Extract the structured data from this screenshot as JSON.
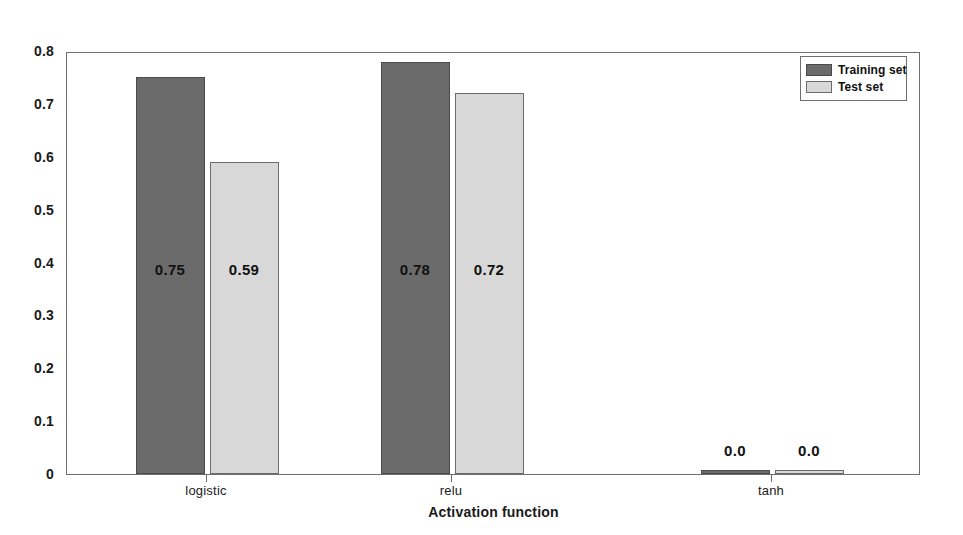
{
  "chart_data": {
    "type": "bar",
    "title": "",
    "xlabel": "Activation function",
    "ylabel": "",
    "categories": [
      "logistic",
      "relu",
      "tanh"
    ],
    "series": [
      {
        "name": "Training set",
        "color": "#6b6b6b",
        "values": [
          0.75,
          0.78,
          0.0
        ],
        "labels": [
          "0.75",
          "0.78",
          "0.0"
        ]
      },
      {
        "name": "Test set",
        "color": "#d8d8d8",
        "values": [
          0.59,
          0.72,
          0.0
        ],
        "labels": [
          "0.59",
          "0.72",
          "0.0"
        ]
      }
    ],
    "ylim": [
      0,
      0.8
    ],
    "ytick_labels": [
      "0",
      "0.1",
      "0.2",
      "0.3",
      "0.4",
      "0.5",
      "0.6",
      "0.7",
      "0.8"
    ],
    "ytick_values": [
      0,
      0.1,
      0.2,
      0.3,
      0.4,
      0.5,
      0.6,
      0.7,
      0.8
    ],
    "grid": false,
    "legend_position": "top-right",
    "legend_entries": [
      "Training set",
      "Test set"
    ]
  },
  "axis": {
    "x_title": "Activation function",
    "y_ticks": [
      {
        "label": "0.8"
      },
      {
        "label": "0.7"
      },
      {
        "label": "0.6"
      },
      {
        "label": "0.5"
      },
      {
        "label": "0.4"
      },
      {
        "label": "0.3"
      },
      {
        "label": "0.2"
      },
      {
        "label": "0.1"
      },
      {
        "label": "0"
      }
    ],
    "x_categories": [
      {
        "label": "logistic"
      },
      {
        "label": "relu"
      },
      {
        "label": "tanh"
      }
    ]
  },
  "legend": {
    "rows": [
      {
        "label": "Training set"
      },
      {
        "label": "Test set"
      }
    ]
  },
  "bars": [
    {
      "label": "0.75"
    },
    {
      "label": "0.59"
    },
    {
      "label": "0.78"
    },
    {
      "label": "0.72"
    },
    {
      "label": "0.0"
    },
    {
      "label": "0.0"
    }
  ]
}
